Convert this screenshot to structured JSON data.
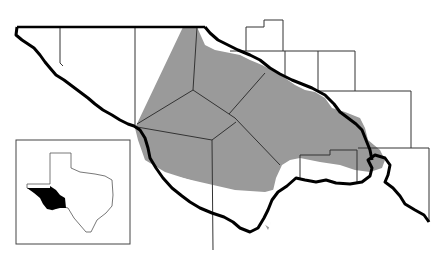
{
  "map": {
    "title": "",
    "type": "regional locator map",
    "region": "Trans-Pecos / Big Bend area, West Texas",
    "legend": [],
    "colors": {
      "shaded_area": "#9a9a9a",
      "river_border": "#000000",
      "county_lines": "#333333",
      "inset_highlight": "#000000",
      "background": "#ffffff"
    },
    "inset": {
      "description": "Outline of Texas with highlighted western region",
      "highlight_color": "#000000"
    }
  }
}
